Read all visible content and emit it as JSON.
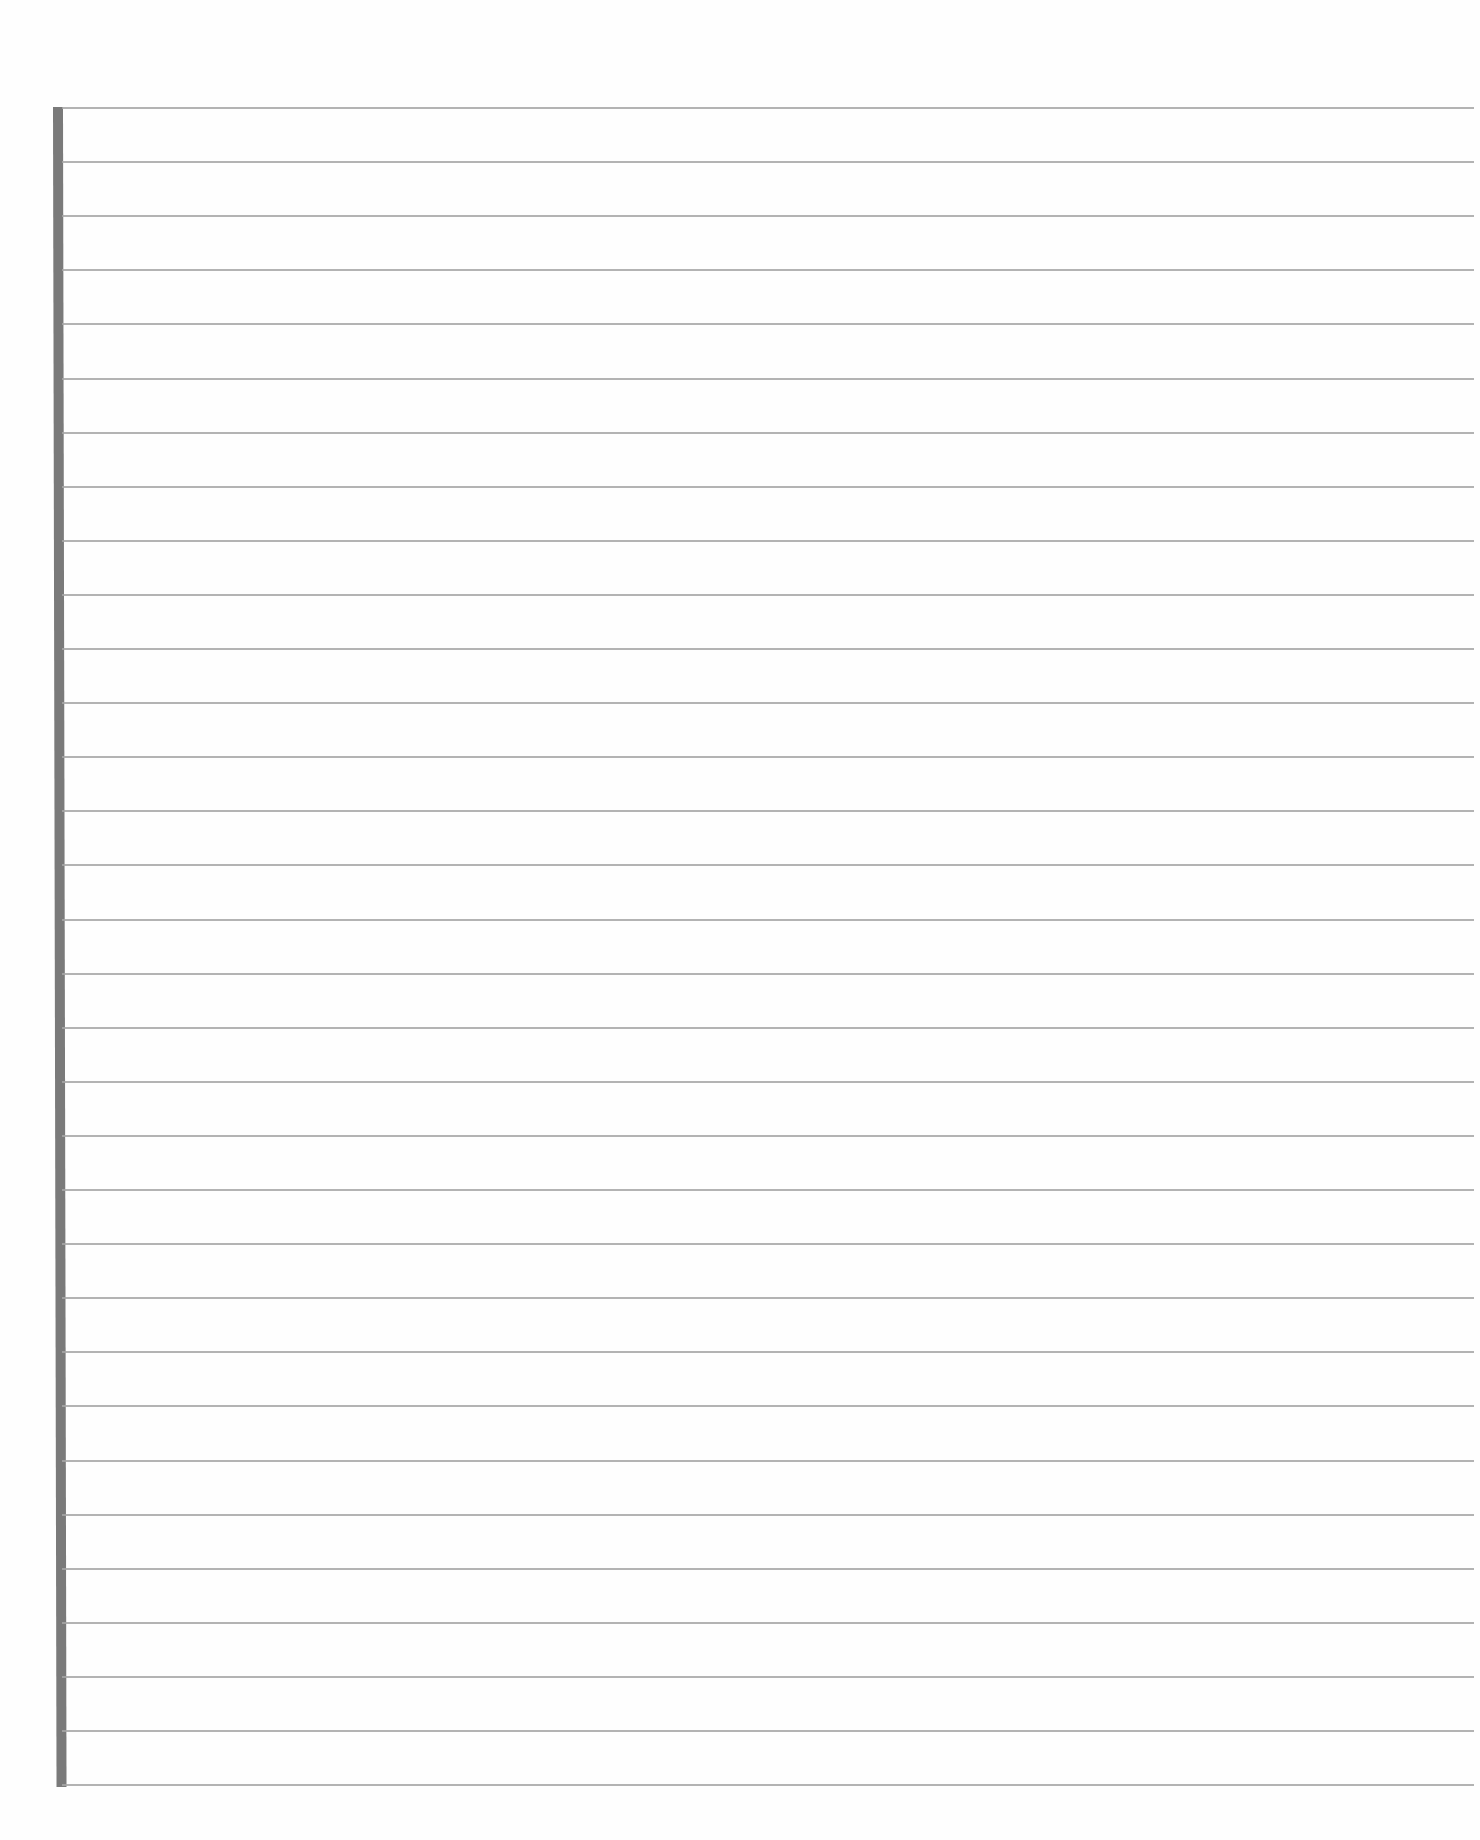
{
  "page": {
    "type": "blank lined paper",
    "line_count": 32,
    "first_line_y": 108,
    "line_spacing": 54.1,
    "colors": {
      "background": "#fefefe",
      "rule_line": "#a6a6a6",
      "margin_bar": "#7a7a7a"
    },
    "lines": []
  }
}
